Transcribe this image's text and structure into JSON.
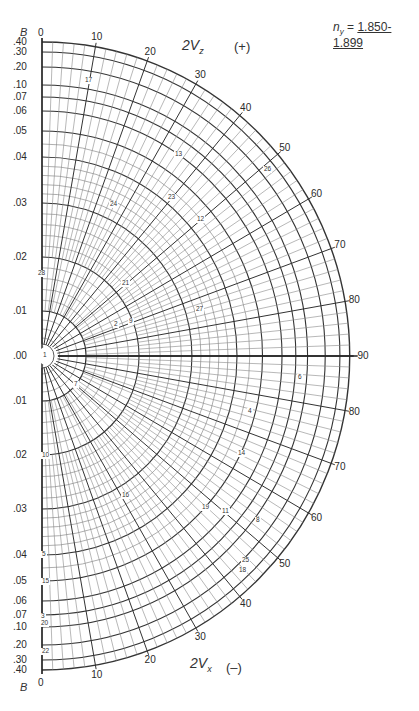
{
  "header": {
    "ny_symbol": "n",
    "ny_sub": "y",
    "ny_eq": " = ",
    "ny_range": "1.850-1.899"
  },
  "upper_axis": {
    "title_main": "2V",
    "title_sub": "z",
    "sign": "(+)"
  },
  "lower_axis": {
    "title_main": "2V",
    "title_sub": "x",
    "sign": "(–)"
  },
  "b_axis_label": "B",
  "chart_data": {
    "type": "polar-nomogram",
    "angular_axis": {
      "upper_label": "2Vz (+)",
      "lower_label": "2Vx (-)",
      "ticks_deg": [
        0,
        10,
        20,
        30,
        40,
        50,
        60,
        70,
        80,
        90
      ],
      "range": [
        0,
        90
      ]
    },
    "radial_axis": {
      "label": "B",
      "ticks": [
        ".00",
        ".01",
        ".02",
        ".03",
        ".04",
        ".05",
        ".06",
        ".07",
        ".10",
        ".20",
        ".30",
        ".40"
      ],
      "values": [
        0.0,
        0.01,
        0.02,
        0.03,
        0.04,
        0.05,
        0.06,
        0.07,
        0.1,
        0.2,
        0.3,
        0.4
      ],
      "radius_px": [
        0,
        45,
        99,
        153,
        199,
        225,
        245,
        259,
        271,
        289,
        304,
        314
      ]
    },
    "grid": true,
    "mineral_points": [
      {
        "id": "1",
        "x": 45,
        "y": 356
      },
      {
        "id": "2",
        "x": 116,
        "y": 325
      },
      {
        "id": "9",
        "x": 131,
        "y": 322
      },
      {
        "id": "21",
        "x": 124,
        "y": 284
      },
      {
        "id": "27",
        "x": 198,
        "y": 310
      },
      {
        "id": "24",
        "x": 112,
        "y": 205
      },
      {
        "id": "23",
        "x": 170,
        "y": 198
      },
      {
        "id": "12",
        "x": 199,
        "y": 220
      },
      {
        "id": "13",
        "x": 177,
        "y": 155
      },
      {
        "id": "17",
        "x": 87,
        "y": 81
      },
      {
        "id": "26",
        "x": 266,
        "y": 170
      },
      {
        "id": "28",
        "x": 40,
        "y": 274
      },
      {
        "id": "7",
        "x": 76,
        "y": 385
      },
      {
        "id": "10",
        "x": 44,
        "y": 456
      },
      {
        "id": "16",
        "x": 124,
        "y": 496
      },
      {
        "id": "19",
        "x": 204,
        "y": 508
      },
      {
        "id": "11",
        "x": 224,
        "y": 512
      },
      {
        "id": "8",
        "x": 258,
        "y": 521
      },
      {
        "id": "14",
        "x": 240,
        "y": 454
      },
      {
        "id": "4",
        "x": 250,
        "y": 412
      },
      {
        "id": "6",
        "x": 300,
        "y": 378
      },
      {
        "id": "25",
        "x": 244,
        "y": 561
      },
      {
        "id": "18",
        "x": 241,
        "y": 571
      },
      {
        "id": "5",
        "x": 44,
        "y": 555
      },
      {
        "id": "15",
        "x": 44,
        "y": 582
      },
      {
        "id": "3",
        "x": 43,
        "y": 617
      },
      {
        "id": "20",
        "x": 43,
        "y": 624
      },
      {
        "id": "22",
        "x": 44,
        "y": 652
      }
    ]
  }
}
